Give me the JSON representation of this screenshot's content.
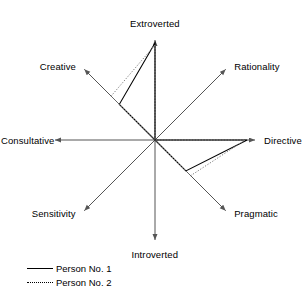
{
  "chart_data": {
    "type": "radar",
    "title": "",
    "xlabel": "",
    "ylabel": "",
    "grid": false,
    "legend_position": "bottom-left",
    "axis_max": 1.0,
    "axis_min": 0.0,
    "categories": [
      "Extroverted",
      "Rationality",
      "Directive",
      "Pragmatic",
      "Introverted",
      "Sensitivity",
      "Consultative",
      "Creative"
    ],
    "series": [
      {
        "name": "Person No. 1",
        "style": "solid",
        "color": "#000000",
        "values": [
          1.0,
          0.0,
          0.95,
          0.45,
          0.0,
          0.0,
          0.0,
          0.52
        ]
      },
      {
        "name": "Person No. 2",
        "style": "dotted",
        "color": "#808080",
        "values": [
          0.98,
          0.0,
          0.93,
          0.52,
          0.0,
          0.0,
          0.0,
          0.64
        ]
      }
    ]
  },
  "axes": {
    "labels": [
      {
        "text": "Extroverted",
        "name": "axis-label-extroverted"
      },
      {
        "text": "Rationality",
        "name": "axis-label-rationality"
      },
      {
        "text": "Directive",
        "name": "axis-label-directive"
      },
      {
        "text": "Pragmatic",
        "name": "axis-label-pragmatic"
      },
      {
        "text": "Introverted",
        "name": "axis-label-introverted"
      },
      {
        "text": "Sensitivity",
        "name": "axis-label-sensitivity"
      },
      {
        "text": "Consultative",
        "name": "axis-label-consultative"
      },
      {
        "text": "Creative",
        "name": "axis-label-creative"
      }
    ]
  },
  "legend": {
    "entries": [
      {
        "label": "Person No. 1",
        "style": "solid"
      },
      {
        "label": "Person No. 2",
        "style": "dotted"
      }
    ]
  },
  "colors": {
    "axis": "#555555",
    "series1": "#000000",
    "series2": "#8a8a8a",
    "background": "#ffffff"
  }
}
